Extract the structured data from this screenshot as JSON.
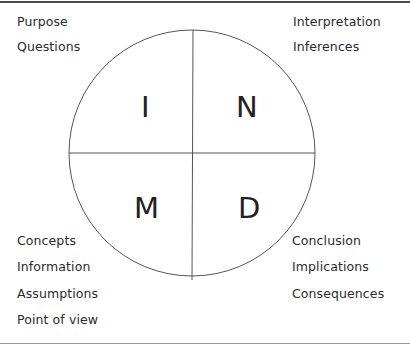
{
  "diagram": {
    "colors": {
      "line": "#555555",
      "text": "#2b2b2b",
      "frame": "#4a4a4a"
    },
    "quadrants": {
      "top_left": "I",
      "top_right": "N",
      "bottom_left": "M",
      "bottom_right": "D"
    },
    "labels": {
      "top_left": [
        "Purpose",
        "Questions"
      ],
      "top_right": [
        "Interpretation",
        "Inferences"
      ],
      "bottom_left": [
        "Concepts",
        "Information",
        "Assumptions",
        "Point of view"
      ],
      "bottom_right": [
        "Conclusion",
        "Implications",
        "Consequences"
      ]
    }
  }
}
